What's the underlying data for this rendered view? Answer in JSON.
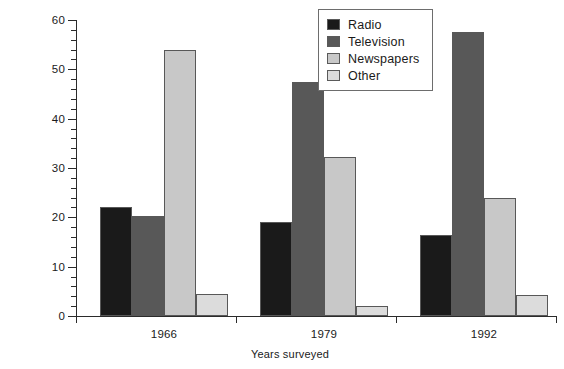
{
  "chart_data": {
    "type": "bar",
    "title": "",
    "xlabel": "Years surveyed",
    "ylabel": "Percentage of Australian adults",
    "categories": [
      "1966",
      "1979",
      "1992"
    ],
    "series": [
      {
        "name": "Radio",
        "color": "#1a1a1a",
        "values": [
          22.0,
          19.0,
          16.5
        ]
      },
      {
        "name": "Television",
        "color": "#585858",
        "values": [
          20.2,
          47.5,
          57.5
        ]
      },
      {
        "name": "Newspapers",
        "color": "#c8c8c8",
        "values": [
          54.0,
          32.2,
          24.0
        ]
      },
      {
        "name": "Other",
        "color": "#dcdcdc",
        "values": [
          4.5,
          2.0,
          4.3
        ]
      }
    ],
    "ylim": [
      0,
      60
    ],
    "y_major_ticks": [
      0,
      10,
      20,
      30,
      40,
      50,
      60
    ],
    "y_minor_tick_step": 2,
    "grid": false,
    "legend_position": "top-center-right"
  },
  "legend": {
    "items": [
      {
        "label": "Radio"
      },
      {
        "label": "Television"
      },
      {
        "label": "Newspapers"
      },
      {
        "label": "Other"
      }
    ]
  },
  "axes": {
    "y_title": "Percentage of Australian adults",
    "x_title": "Years surveyed",
    "y_tick_labels": [
      "0",
      "10",
      "20",
      "30",
      "40",
      "50",
      "60"
    ],
    "x_tick_labels": [
      "1966",
      "1979",
      "1992"
    ]
  }
}
